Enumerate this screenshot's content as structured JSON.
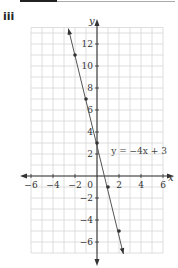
{
  "header": {
    "part_label": "iii"
  },
  "chart_data": {
    "type": "line",
    "title": "",
    "xlabel": "x",
    "ylabel": "y",
    "xlim": [
      -6,
      6
    ],
    "ylim": [
      -7,
      13.5
    ],
    "grid": true,
    "x_ticks": [
      -6,
      -4,
      -2,
      2,
      4,
      6
    ],
    "x_tick_labels": [
      "−6",
      "−4",
      "−2",
      "2",
      "4",
      "6"
    ],
    "y_ticks": [
      12,
      10,
      8,
      6,
      4,
      2,
      -2,
      -4,
      -6
    ],
    "y_tick_labels": [
      "12",
      "10",
      "8",
      "6",
      "4",
      "2",
      "−2",
      "−4",
      "−6"
    ],
    "origin_label": "0",
    "series": [
      {
        "name": "y = −4x + 3",
        "equation": "y = −4x + 3",
        "slope": -4,
        "intercept": 3,
        "x": [
          -2,
          -1,
          0,
          1,
          2
        ],
        "y": [
          11,
          7,
          3,
          -1,
          -5
        ],
        "line_extent": {
          "x_start": -2.6,
          "y_start": 13.4,
          "x_end": 2.4,
          "y_end": -7.1
        },
        "color": "#555555"
      }
    ],
    "annotations": [
      {
        "text": "y = −4x + 3",
        "x": 1.2,
        "y": 2
      }
    ]
  }
}
